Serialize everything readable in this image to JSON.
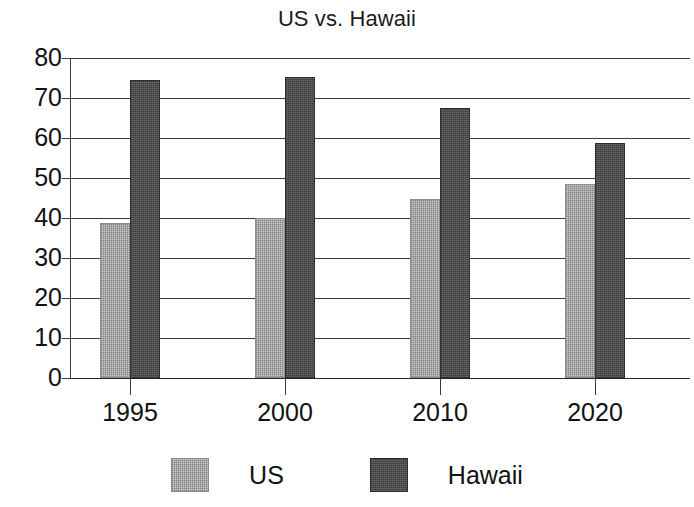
{
  "chart_data": {
    "type": "bar",
    "title": "US vs. Hawaii",
    "clipped_title_above": "",
    "xlabel": "",
    "ylabel": "",
    "categories": [
      "1995",
      "2000",
      "2010",
      "2020"
    ],
    "series": [
      {
        "name": "US",
        "color": "#c9c9c9",
        "values": [
          38.8,
          40.0,
          44.8,
          48.6
        ]
      },
      {
        "name": "Hawaii",
        "color": "#4d4d4d",
        "values": [
          74.4,
          75.2,
          67.5,
          58.8
        ]
      }
    ],
    "ylim": [
      0,
      80
    ],
    "ytick_labels": [
      "80",
      "70",
      "60",
      "50",
      "40",
      "30",
      "20",
      "10",
      "0"
    ],
    "ytick_values": [
      80,
      70,
      60,
      50,
      40,
      30,
      20,
      10,
      0
    ],
    "grid": true,
    "legend_position": "bottom"
  },
  "legend": {
    "entries": [
      {
        "label": "US",
        "swatch": "legend-swatch-us"
      },
      {
        "label": "Hawaii",
        "swatch": "legend-swatch-hawaii"
      }
    ]
  }
}
